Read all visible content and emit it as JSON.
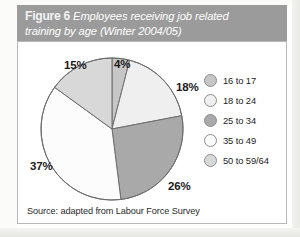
{
  "figure": {
    "number_label": "Figure 6",
    "caption_line1": "Employees receiving job related",
    "caption_line2": "training by age (Winter 2004/05)",
    "source_note": "Source: adapted from Labour Force Survey"
  },
  "colors": {
    "header_band": "#9b9b9b",
    "header_text": "#ffffff",
    "panel_background": "#ffffff",
    "panel_border": "#b9b9b9",
    "slice_stroke": "#6e6e6e",
    "label_text": "#1a1a1a"
  },
  "chart_data": {
    "type": "pie",
    "title": "Employees receiving job related training by age (Winter 2004/05)",
    "xlabel": "",
    "ylabel": "",
    "legend_position": "right",
    "grid": false,
    "categories": [
      "16 to 17",
      "18 to 24",
      "25 to 34",
      "35 to 49",
      "50 to 59/64"
    ],
    "values": [
      4,
      18,
      26,
      37,
      15
    ],
    "value_labels": [
      "4%",
      "18%",
      "26%",
      "37%",
      "15%"
    ],
    "unit": "%",
    "slice_colors": [
      "#c6c6c6",
      "#efefef",
      "#a9a9a9",
      "#fcfcfc",
      "#d8d8d8"
    ],
    "start_angle_deg": 0,
    "direction": "clockwise"
  },
  "legend": {
    "items": [
      {
        "label": "16 to 17",
        "color": "#c6c6c6"
      },
      {
        "label": "18 to 24",
        "color": "#efefef"
      },
      {
        "label": "25 to 34",
        "color": "#a9a9a9"
      },
      {
        "label": "35 to 49",
        "color": "#fcfcfc"
      },
      {
        "label": "50 to 59/64",
        "color": "#d8d8d8"
      }
    ]
  }
}
